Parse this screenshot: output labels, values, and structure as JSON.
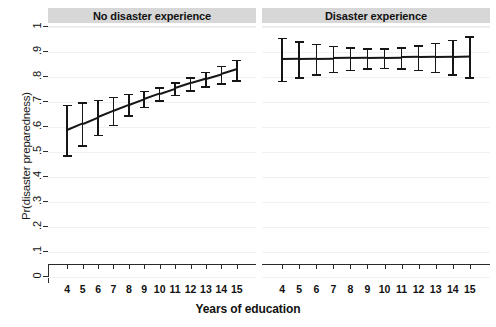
{
  "chart_data": {
    "type": "line",
    "title": "",
    "xlabel": "Years of education",
    "ylabel": "Pr(disaster preparedness)",
    "xlim": [
      3.4,
      15.6
    ],
    "ylim": [
      0,
      1
    ],
    "grid": true,
    "legend_position": "none",
    "xticks": [
      4,
      5,
      6,
      7,
      8,
      9,
      10,
      11,
      12,
      13,
      14,
      15
    ],
    "xtick_labels": [
      "4",
      "5",
      "6",
      "7",
      "8",
      "9",
      "10",
      "11",
      "12",
      "13",
      "14",
      "15"
    ],
    "yticks": [
      0,
      0.1,
      0.2,
      0.3,
      0.4,
      0.5,
      0.6,
      0.7,
      0.8,
      0.9,
      1
    ],
    "ytick_labels": [
      "0",
      ".1",
      ".2",
      ".3",
      ".4",
      ".5",
      ".6",
      ".7",
      ".8",
      ".9",
      "1"
    ],
    "panels": [
      {
        "title": "No disaster experience",
        "x": [
          4,
          5,
          6,
          7,
          8,
          9,
          10,
          11,
          12,
          13,
          14,
          15
        ],
        "values": [
          0.588,
          0.614,
          0.64,
          0.665,
          0.689,
          0.712,
          0.734,
          0.755,
          0.775,
          0.793,
          0.811,
          0.83
        ],
        "ci_low": [
          0.488,
          0.528,
          0.57,
          0.61,
          0.648,
          0.681,
          0.708,
          0.73,
          0.748,
          0.763,
          0.776,
          0.787
        ],
        "ci_high": [
          0.69,
          0.7,
          0.71,
          0.721,
          0.733,
          0.746,
          0.76,
          0.779,
          0.8,
          0.822,
          0.845,
          0.87
        ]
      },
      {
        "title": "Disaster experience",
        "x": [
          4,
          5,
          6,
          7,
          8,
          9,
          10,
          11,
          12,
          13,
          14,
          15
        ],
        "values": [
          0.872,
          0.873,
          0.874,
          0.875,
          0.876,
          0.877,
          0.878,
          0.879,
          0.88,
          0.881,
          0.882,
          0.884
        ],
        "ci_low": [
          0.785,
          0.8,
          0.812,
          0.822,
          0.83,
          0.836,
          0.838,
          0.836,
          0.83,
          0.822,
          0.812,
          0.8
        ],
        "ci_high": [
          0.957,
          0.944,
          0.934,
          0.926,
          0.92,
          0.916,
          0.916,
          0.92,
          0.928,
          0.938,
          0.95,
          0.963
        ]
      }
    ]
  }
}
